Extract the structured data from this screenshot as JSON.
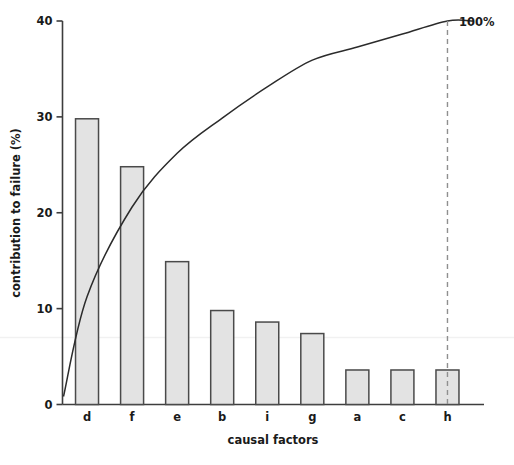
{
  "chart_data": {
    "type": "bar",
    "title": "",
    "subtitle": "",
    "xlabel": "causal factors",
    "ylabel": "contribution to failure (%)",
    "categories": [
      "d",
      "f",
      "e",
      "b",
      "i",
      "g",
      "a",
      "c",
      "h"
    ],
    "values": [
      29.8,
      24.8,
      14.9,
      9.8,
      8.6,
      7.4,
      3.6,
      3.6,
      3.6
    ],
    "series": [
      {
        "name": "contribution to failure (%)",
        "type": "bar",
        "values": [
          29.8,
          24.8,
          14.9,
          9.8,
          8.6,
          7.4,
          3.6,
          3.6,
          3.6
        ]
      },
      {
        "name": "cumulative percentage",
        "type": "line",
        "values": [
          29.8,
          54.6,
          69.5,
          79.3,
          87.9,
          95.3,
          98.9,
          102.5,
          106.1
        ],
        "cumulative_percent": [
          28.1,
          51.5,
          65.5,
          74.7,
          82.8,
          89.8,
          93.2,
          96.6,
          100.0
        ]
      }
    ],
    "ylim": [
      0,
      40
    ],
    "yticks": [
      0,
      10,
      20,
      30,
      40
    ],
    "ytick_labels": [
      "0",
      "10",
      "20",
      "30",
      "40"
    ],
    "xlim_categories": 9,
    "grid": false,
    "legend": "none",
    "annotations": [
      {
        "text": "100%",
        "x_category": "h",
        "note": "end of cumulative curve at right, beside dashed vertical reference line"
      }
    ],
    "colors": {
      "bar_fill": "#e3e3e3",
      "bar_stroke": "#4a4a4a",
      "axis": "#3d3d3d",
      "curve": "#2b2b2b",
      "dashed_line": "#8c8c8c",
      "faint_gridline": "#f0f0f0",
      "text": "#1a1a1a"
    }
  },
  "labels": {
    "cumulative_end_label": "100%",
    "ylabel": "contribution to failure (%)",
    "xlabel": "causal factors"
  }
}
